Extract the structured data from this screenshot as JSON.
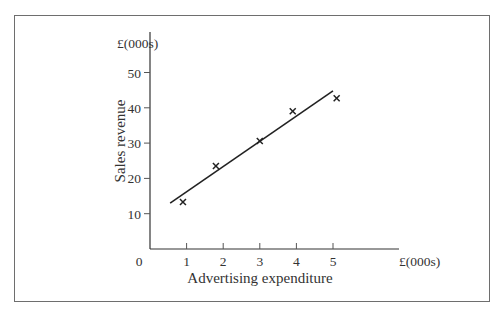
{
  "chart_data": {
    "type": "scatter",
    "title": "",
    "xlabel": "Advertising expenditure",
    "ylabel": "Sales revenue",
    "x_unit": "£(000s)",
    "y_unit": "£(000s)",
    "origin_label": "0",
    "x_ticks": [
      1,
      2,
      3,
      4,
      5
    ],
    "y_ticks": [
      10,
      20,
      30,
      40,
      50
    ],
    "xlim": [
      0,
      6.8
    ],
    "ylim": [
      0,
      61
    ],
    "grid": false,
    "legend": null,
    "points": [
      {
        "x": 0.9,
        "y": 13.3
      },
      {
        "x": 1.8,
        "y": 23.5
      },
      {
        "x": 3.0,
        "y": 30.6
      },
      {
        "x": 3.9,
        "y": 39.0
      },
      {
        "x": 5.1,
        "y": 42.7
      }
    ],
    "marker": "x",
    "fit_line": {
      "x1": 0.55,
      "y1": 13.0,
      "x2": 5.0,
      "y2": 44.8
    }
  },
  "colors": {
    "axis": "#333333",
    "frame": "#6e6e6e",
    "markers": "#222222"
  }
}
